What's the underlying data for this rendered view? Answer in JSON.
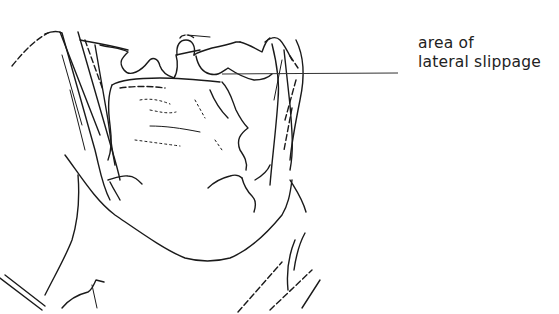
{
  "figure": {
    "type": "anatomical line drawing",
    "annotation": {
      "line1": "area of",
      "line2": "lateral slippage",
      "leader_line_color": "#333333"
    },
    "colors": {
      "background": "#ffffff",
      "ink": "#1a1a1a"
    }
  }
}
